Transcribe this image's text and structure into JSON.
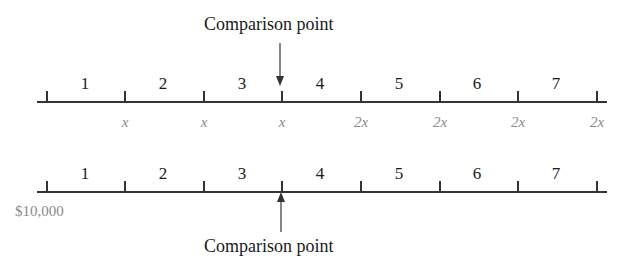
{
  "top_timeline": {
    "caption": "Comparison point",
    "periods": [
      "1",
      "2",
      "3",
      "4",
      "5",
      "6",
      "7"
    ],
    "cash_flows": [
      "x",
      "x",
      "x",
      "2x",
      "2x",
      "2x",
      "2x"
    ],
    "comparison_at_tick": 3
  },
  "bottom_timeline": {
    "caption": "Comparison point",
    "periods": [
      "1",
      "2",
      "3",
      "4",
      "5",
      "6",
      "7"
    ],
    "initial_amount": "$10,000",
    "comparison_at_tick": 3
  },
  "colors": {
    "line": "#333333",
    "text": "#1a1a1a",
    "cash_flow_text": "#8a8a8a"
  }
}
